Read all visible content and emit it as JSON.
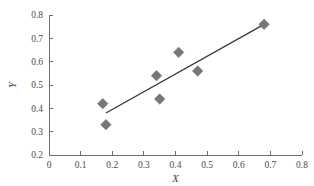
{
  "chart_data": {
    "type": "scatter",
    "title": "",
    "xlabel": "X",
    "ylabel": "Y",
    "xlim": [
      0,
      0.8
    ],
    "ylim": [
      0.2,
      0.8
    ],
    "grid": false,
    "legend": "none",
    "x_ticks": [
      "0",
      "0.1",
      "0.2",
      "0.3",
      "0.4",
      "0.5",
      "0.6",
      "0.7",
      "0.8"
    ],
    "x_tick_values": [
      0,
      0.1,
      0.2,
      0.3,
      0.4,
      0.5,
      0.6,
      0.7,
      0.8
    ],
    "y_ticks": [
      "0.2",
      "0.3",
      "0.4",
      "0.5",
      "0.6",
      "0.7",
      "0.8"
    ],
    "y_tick_values": [
      0.2,
      0.3,
      0.4,
      0.5,
      0.6,
      0.7,
      0.8
    ],
    "marker": "diamond",
    "marker_color": "#777777",
    "series": [
      {
        "name": "data",
        "points": [
          {
            "x": 0.17,
            "y": 0.42
          },
          {
            "x": 0.18,
            "y": 0.33
          },
          {
            "x": 0.34,
            "y": 0.54
          },
          {
            "x": 0.35,
            "y": 0.44
          },
          {
            "x": 0.41,
            "y": 0.64
          },
          {
            "x": 0.47,
            "y": 0.56
          },
          {
            "x": 0.68,
            "y": 0.76
          }
        ]
      }
    ],
    "trendline": {
      "type": "linear",
      "color": "#3a3a3a",
      "x_start": 0.18,
      "y_start": 0.38,
      "x_end": 0.68,
      "y_end": 0.76
    }
  }
}
